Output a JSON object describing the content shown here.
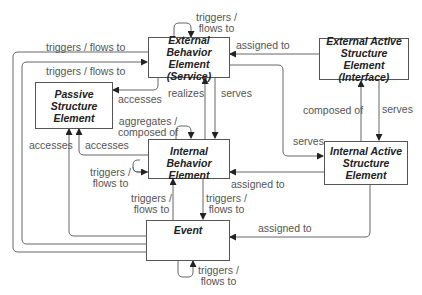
{
  "diagram": {
    "nodes": {
      "ext_behavior": "External Behavior\nElement\n(Service)",
      "ext_active": "External Active\nStructure Element\n(Interface)",
      "passive": "Passive\nStructure\nElement",
      "int_behavior": "Internal Behavior\nElement",
      "int_active": "Internal Active\nStructure\nElement",
      "event": "Event"
    },
    "edges": {
      "ext_behavior_self": "triggers /\nflows to",
      "ext_active_to_ext_behavior": "assigned to",
      "event_to_ext_behavior_outer": "triggers / flows to",
      "event_to_ext_behavior_inner": "triggers / flows to",
      "ext_behavior_to_passive": "accesses",
      "int_behavior_realizes": "realizes",
      "ext_behavior_serves": "serves",
      "int_behavior_self": "aggregates /\ncomposed of",
      "event_accesses_passive": "accesses",
      "int_behavior_accesses_passive": "accesses",
      "ext_active_composed_of": "composed of",
      "ext_active_serves": "serves",
      "ext_behavior_serves_int_active": "serves",
      "int_behavior_triggers_self": "triggers /\nflows to",
      "int_active_assigned_int_behavior": "assigned to",
      "event_triggers_int_behavior": "triggers /\nflows to",
      "int_behavior_triggers_event": "triggers /\nflows to",
      "int_active_assigned_event": "assigned to",
      "event_self": "triggers /\nflows to"
    }
  }
}
